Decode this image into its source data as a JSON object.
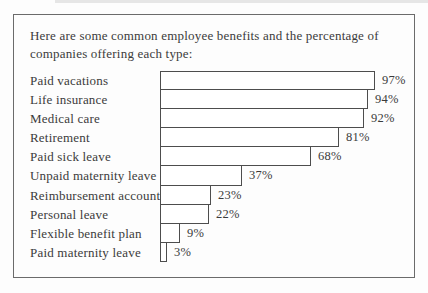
{
  "intro": {
    "lines": [
      "Here are some common employee benefits and the percentage of",
      "companies offering each type:"
    ]
  },
  "chart_data": {
    "type": "bar",
    "orientation": "horizontal",
    "title": "Here are some common employee benefits and the percentage of companies offering each type:",
    "categories": [
      "Paid vacations",
      "Life insurance",
      "Medical care",
      "Retirement",
      "Paid sick leave",
      "Unpaid maternity leave",
      "Reimbursement accounts",
      "Personal leave",
      "Flexible benefit plan",
      "Paid maternity leave"
    ],
    "values": [
      97,
      94,
      92,
      81,
      68,
      37,
      23,
      22,
      9,
      3
    ],
    "value_labels": [
      "97%",
      "94%",
      "92%",
      "81%",
      "68%",
      "37%",
      "23%",
      "22%",
      "9%",
      "3%"
    ],
    "xlabel": "",
    "ylabel": "",
    "xlim": [
      0,
      100
    ],
    "grid": false,
    "legend": "none",
    "bar_fill": "#ffffff",
    "bar_border": "#4d4d4d",
    "text_color": "#3b3b3b"
  }
}
